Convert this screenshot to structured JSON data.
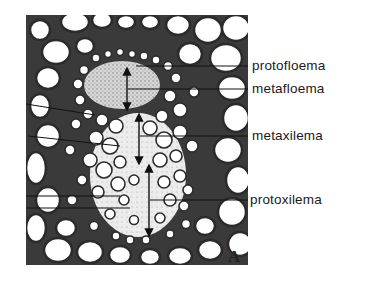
{
  "figure": {
    "panel_letter": "A",
    "labels": [
      {
        "id": "protofloema",
        "text": "protofloema",
        "y": 66
      },
      {
        "id": "metafloema",
        "text": "metafloema",
        "y": 89
      },
      {
        "id": "metaxilema",
        "text": "metaxilema",
        "y": 136
      },
      {
        "id": "protoxilema",
        "text": "protoxilema",
        "y": 200
      }
    ],
    "colors": {
      "background": "#ffffff",
      "cell_wall": "#2b2b2b",
      "phloem_region": "#bdbdbd",
      "xylem_region": "#e0e0e0"
    }
  }
}
